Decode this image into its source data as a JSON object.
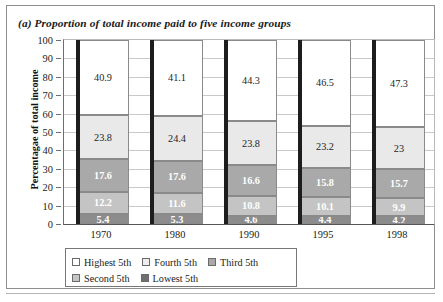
{
  "figure": {
    "caption": "(a) Proportion of total income paid to five income groups"
  },
  "chart_data": {
    "type": "bar",
    "subtype": "stacked-column-100",
    "title": "(a) Proportion of total income paid to five income groups",
    "xlabel": "",
    "ylabel": "Percentagae of total income",
    "ylim": [
      0,
      100
    ],
    "yticks": [
      0,
      10,
      20,
      30,
      40,
      50,
      60,
      70,
      80,
      90,
      100
    ],
    "grid": true,
    "legend_position": "bottom-left",
    "categories": [
      "1970",
      "1980",
      "1990",
      "1995",
      "1998"
    ],
    "series": [
      {
        "name": "Highest 5th",
        "color": "#ffffff",
        "values": [
          40.9,
          41.1,
          44.3,
          46.5,
          47.3
        ],
        "labels": [
          "40.9",
          "41.1",
          "44.3",
          "46.5",
          "47.3"
        ]
      },
      {
        "name": "Fourth 5th",
        "color": "#e9e9e9",
        "values": [
          23.8,
          24.4,
          23.8,
          23.2,
          23.0
        ],
        "labels": [
          "23.8",
          "24.4",
          "23.8",
          "23.2",
          "23"
        ]
      },
      {
        "name": "Third 5th",
        "color": "#a9a9a9",
        "values": [
          17.6,
          17.6,
          16.6,
          15.8,
          15.7
        ],
        "labels": [
          "17.6",
          "17.6",
          "16.6",
          "15.8",
          "15.7"
        ]
      },
      {
        "name": "Second 5th",
        "color": "#c4c4c4",
        "values": [
          12.2,
          11.6,
          10.8,
          10.1,
          9.9
        ],
        "labels": [
          "12.2",
          "11.6",
          "10.8",
          "10.1",
          "9.9"
        ]
      },
      {
        "name": "Lowest 5th",
        "color": "#8c8c8c",
        "values": [
          5.4,
          5.3,
          4.6,
          4.4,
          4.2
        ],
        "labels": [
          "5.4",
          "5.3",
          "4.6",
          "4.4",
          "4.2"
        ]
      }
    ]
  },
  "legend": {
    "rows": [
      [
        {
          "label": "Highest 5th",
          "color": "#ffffff"
        },
        {
          "label": "Fourth 5th",
          "color": "#ededed"
        },
        {
          "label": "Third 5th",
          "color": "#a9a9a9"
        }
      ],
      [
        {
          "label": "Second 5th",
          "color": "#c4c4c4"
        },
        {
          "label": "Lowest 5th",
          "color": "#6f6f6f"
        }
      ]
    ]
  }
}
